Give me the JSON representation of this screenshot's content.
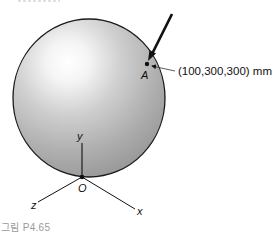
{
  "figure": {
    "caption": "그림 P4.65",
    "point_label": "A",
    "point_coordinates": "(100,300,300) mm",
    "axes": {
      "origin_label": "O",
      "x_label": "x",
      "y_label": "y",
      "z_label": "z"
    },
    "colors": {
      "sphere_edge": "#9e9e9e",
      "sphere_highlight": "#ffffff",
      "outline": "#1a1a1a",
      "caption": "#9a9a9a"
    }
  }
}
